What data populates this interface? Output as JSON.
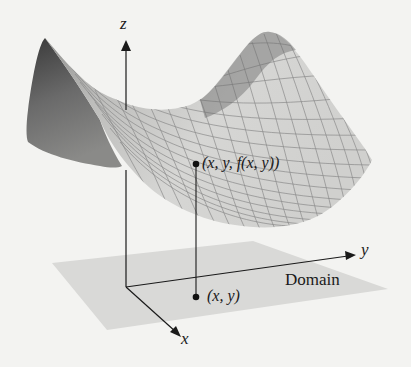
{
  "figure": {
    "axes": {
      "x_label": "x",
      "y_label": "y",
      "z_label": "z"
    },
    "surface_point_label": "(x, y, f(x, y))",
    "domain_point_label": "(x, y)",
    "domain_label": "Domain",
    "colors": {
      "background": "#f3f3f1",
      "domain_plane": "#d9d9d7",
      "surface_light": "#d6d6d4",
      "surface_dark": "#4a4a4a",
      "grid_lines": "#8a8a8a",
      "axis": "#1a1a1a"
    }
  }
}
